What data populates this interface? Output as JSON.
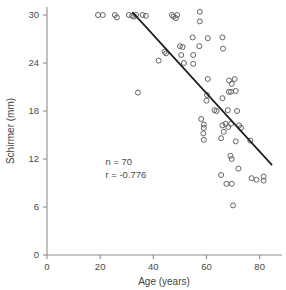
{
  "chart_data": {
    "type": "scatter",
    "title": "",
    "xlabel": "Age (years)",
    "ylabel": "Schirmer (mm)",
    "xlim": [
      0,
      86
    ],
    "ylim": [
      0,
      31
    ],
    "xticks": [
      0,
      20,
      40,
      60,
      80
    ],
    "yticks": [
      0,
      6,
      12,
      18,
      24,
      30
    ],
    "xtick_labels": [
      "0",
      "20",
      "40",
      "60",
      "80"
    ],
    "ytick_labels": [
      "0",
      "6",
      "12",
      "18",
      "24",
      "30"
    ],
    "grid": false,
    "legend": null,
    "n": 70,
    "r": -0.776,
    "annotations": [
      {
        "text": "n = 70",
        "x": 22,
        "y": 11.2
      },
      {
        "text": "r = -0.776",
        "x": 22,
        "y": 9.6
      }
    ],
    "series": [
      {
        "name": "Schirmer vs Age",
        "marker": "open-circle",
        "color": "#63636b",
        "points": [
          [
            19.2,
            30.0
          ],
          [
            21.0,
            30.0
          ],
          [
            25.5,
            30.0
          ],
          [
            26.3,
            29.7
          ],
          [
            30.8,
            30.0
          ],
          [
            32.0,
            29.9
          ],
          [
            32.8,
            29.8
          ],
          [
            33.5,
            30.0
          ],
          [
            36.0,
            30.0
          ],
          [
            37.2,
            29.9
          ],
          [
            47.0,
            30.0
          ],
          [
            47.6,
            29.8
          ],
          [
            48.5,
            29.6
          ],
          [
            49.0,
            30.0
          ],
          [
            57.5,
            30.4
          ],
          [
            57.5,
            29.2
          ],
          [
            54.8,
            27.2
          ],
          [
            60.5,
            27.1
          ],
          [
            66.0,
            27.2
          ],
          [
            50.0,
            26.1
          ],
          [
            51.0,
            26.0
          ],
          [
            57.3,
            26.1
          ],
          [
            66.2,
            25.8
          ],
          [
            44.3,
            25.4
          ],
          [
            44.8,
            25.2
          ],
          [
            50.5,
            25.0
          ],
          [
            55.0,
            25.0
          ],
          [
            42.0,
            24.3
          ],
          [
            51.5,
            24.0
          ],
          [
            55.0,
            23.9
          ],
          [
            34.2,
            20.3
          ],
          [
            60.5,
            22.0
          ],
          [
            68.5,
            21.8
          ],
          [
            69.5,
            21.4
          ],
          [
            70.6,
            22.0
          ],
          [
            68.4,
            20.4
          ],
          [
            69.2,
            20.4
          ],
          [
            71.0,
            20.5
          ],
          [
            60.2,
            20.0
          ],
          [
            60.0,
            19.3
          ],
          [
            66.0,
            19.6
          ],
          [
            63.0,
            18.1
          ],
          [
            63.8,
            18.0
          ],
          [
            68.0,
            18.1
          ],
          [
            71.5,
            18.0
          ],
          [
            58.0,
            17.0
          ],
          [
            59.0,
            16.3
          ],
          [
            59.0,
            15.9
          ],
          [
            58.8,
            15.2
          ],
          [
            66.0,
            16.2
          ],
          [
            67.2,
            16.4
          ],
          [
            68.2,
            16.0
          ],
          [
            66.5,
            15.4
          ],
          [
            69.2,
            16.4
          ],
          [
            72.3,
            16.2
          ],
          [
            73.0,
            15.9
          ],
          [
            59.0,
            14.4
          ],
          [
            65.5,
            14.6
          ],
          [
            71.0,
            14.2
          ],
          [
            76.5,
            14.3
          ],
          [
            69.0,
            12.4
          ],
          [
            69.5,
            12.0
          ],
          [
            65.5,
            10.0
          ],
          [
            72.0,
            10.8
          ],
          [
            77.0,
            9.6
          ],
          [
            78.8,
            9.4
          ],
          [
            81.5,
            9.8
          ],
          [
            81.5,
            9.3
          ],
          [
            67.5,
            8.9
          ],
          [
            69.5,
            8.9
          ],
          [
            70.0,
            6.2
          ]
        ]
      }
    ],
    "fit_line": {
      "type": "linear-regression",
      "x_start": 32.3,
      "y_start": 30.3,
      "x_end": 84.5,
      "y_end": 11.3,
      "color": "#1d1d1d"
    }
  }
}
